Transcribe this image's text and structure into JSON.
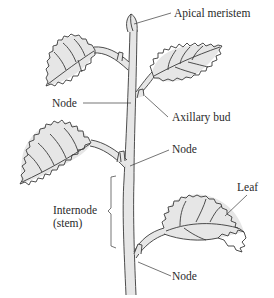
{
  "diagram": {
    "labels": {
      "apical_meristem": "Apical meristem",
      "node_upper": "Node",
      "axillary_bud": "Axillary bud",
      "node_middle": "Node",
      "leaf": "Leaf",
      "internode_line1": "Internode",
      "internode_line2": "(stem)",
      "node_lower": "Node"
    },
    "colors": {
      "tissue_fill": "#e6e6e6",
      "outline": "#3a3a3a",
      "background": "#ffffff"
    }
  }
}
